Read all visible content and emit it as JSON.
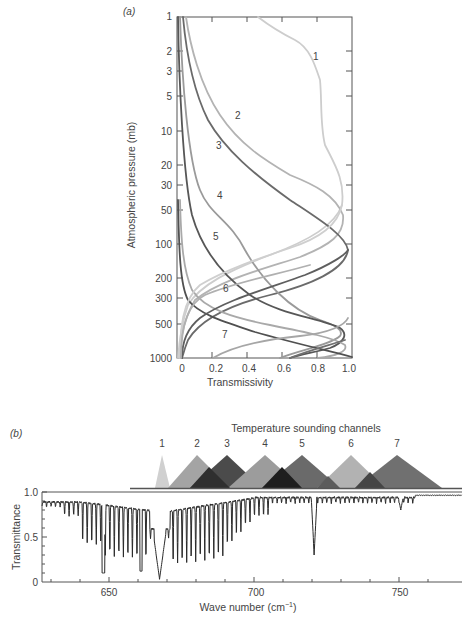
{
  "chart_data": [
    {
      "panel": "(a)",
      "type": "line",
      "title": "",
      "xlabel": "Transmissivity",
      "ylabel": "Atmospheric pressure (mb)",
      "xlim": [
        0,
        1.0
      ],
      "ylim": [
        1000,
        1
      ],
      "yscale": "log",
      "x_ticks": [
        "0",
        "0.2",
        "0.4",
        "0.6",
        "0.8",
        "1.0"
      ],
      "y_ticks": [
        "1",
        "2",
        "3",
        "5",
        "10",
        "20",
        "30",
        "50",
        "100",
        "200",
        "300",
        "500",
        "1000"
      ],
      "grid": false,
      "series": [
        {
          "name": "1",
          "color": "#c8c8c8",
          "transmissivity_curve": [
            [
              0.55,
              1
            ],
            [
              0.72,
              2
            ],
            [
              0.8,
              5
            ],
            [
              0.82,
              10
            ],
            [
              0.88,
              20
            ],
            [
              0.94,
              30
            ],
            [
              0.9,
              50
            ],
            [
              0.6,
              100
            ],
            [
              0.3,
              200
            ],
            [
              0.1,
              300
            ],
            [
              0.04,
              500
            ],
            [
              0,
              1000
            ]
          ]
        },
        {
          "name": "2",
          "color": "#b0b0b0",
          "transmissivity_curve": [
            [
              0.02,
              1
            ],
            [
              0.1,
              2
            ],
            [
              0.2,
              5
            ],
            [
              0.35,
              10
            ],
            [
              0.6,
              20
            ],
            [
              0.82,
              30
            ],
            [
              0.93,
              50
            ],
            [
              0.8,
              100
            ],
            [
              0.45,
              200
            ],
            [
              0.25,
              300
            ],
            [
              0.1,
              500
            ],
            [
              0,
              1000
            ]
          ]
        },
        {
          "name": "3",
          "color": "#6e6e6e",
          "transmissivity_curve": [
            [
              0.02,
              1
            ],
            [
              0.05,
              2
            ],
            [
              0.1,
              5
            ],
            [
              0.18,
              10
            ],
            [
              0.35,
              20
            ],
            [
              0.55,
              30
            ],
            [
              0.8,
              50
            ],
            [
              0.97,
              100
            ],
            [
              0.75,
              200
            ],
            [
              0.45,
              300
            ],
            [
              0.15,
              500
            ],
            [
              0,
              1000
            ]
          ]
        },
        {
          "name": "4",
          "color": "#9a9a9a",
          "transmissivity_curve": [
            [
              0.01,
              1
            ],
            [
              0.02,
              5
            ],
            [
              0.05,
              10
            ],
            [
              0.12,
              20
            ],
            [
              0.18,
              30
            ],
            [
              0.25,
              50
            ],
            [
              0.4,
              100
            ],
            [
              0.6,
              200
            ],
            [
              0.8,
              300
            ],
            [
              0.95,
              400
            ],
            [
              0.7,
              600
            ],
            [
              0.4,
              1000
            ]
          ]
        },
        {
          "name": "5",
          "color": "#5a5a5a",
          "transmissivity_curve": [
            [
              0.01,
              1
            ],
            [
              0.02,
              10
            ],
            [
              0.05,
              30
            ],
            [
              0.1,
              50
            ],
            [
              0.2,
              100
            ],
            [
              0.35,
              200
            ],
            [
              0.55,
              300
            ],
            [
              0.85,
              400
            ],
            [
              0.95,
              500
            ],
            [
              0.7,
              700
            ],
            [
              0.6,
              1000
            ]
          ]
        },
        {
          "name": "6",
          "color": "#a8a8a8",
          "transmissivity_curve": [
            [
              0.02,
              35
            ],
            [
              0.03,
              100
            ],
            [
              0.08,
              200
            ],
            [
              0.2,
              300
            ],
            [
              0.45,
              400
            ],
            [
              0.75,
              500
            ],
            [
              0.95,
              600
            ],
            [
              0.9,
              800
            ],
            [
              0.8,
              1000
            ]
          ]
        },
        {
          "name": "7",
          "color": "#505050",
          "transmissivity_curve": [
            [
              0.01,
              35
            ],
            [
              0.02,
              100
            ],
            [
              0.05,
              200
            ],
            [
              0.12,
              300
            ],
            [
              0.3,
              400
            ],
            [
              0.6,
              550
            ],
            [
              0.85,
              700
            ],
            [
              1.0,
              1000
            ]
          ]
        }
      ]
    },
    {
      "panel": "(b)",
      "type": "line",
      "title": "Temperature sounding channels",
      "xlabel": "Wave number (cm⁻¹)",
      "ylabel": "Transmittance",
      "xlim": [
        627,
        771
      ],
      "ylim": [
        0,
        1.0
      ],
      "x_ticks": [
        "650",
        "700",
        "750"
      ],
      "y_ticks": [
        "0",
        "0.5",
        "1.0"
      ],
      "grid": false,
      "channels": [
        {
          "name": "1",
          "center": 669,
          "half_width": 2.5,
          "color": "#cfcfcf"
        },
        {
          "name": "2",
          "center": 677,
          "half_width": 10,
          "color": "#a3a3a3"
        },
        {
          "name": "3",
          "center": 691,
          "half_width": 12,
          "color": "#4a4a4a"
        },
        {
          "name": "4",
          "center": 704,
          "half_width": 12,
          "color": "#9b9b9b"
        },
        {
          "name": "5",
          "center": 716,
          "half_width": 13,
          "color": "#6c6c6c"
        },
        {
          "name": "6",
          "center": 732,
          "half_width": 12,
          "color": "#b1b1b1"
        },
        {
          "name": "7",
          "center": 748,
          "half_width": 15,
          "color": "#6f6f6f"
        }
      ],
      "transmittance_features": [
        {
          "wavenumber": 627,
          "value": 0.88
        },
        {
          "wavenumber": 640,
          "value": 0.85
        },
        {
          "wavenumber": 648,
          "value": 0.1,
          "note": "deep line"
        },
        {
          "wavenumber": 655,
          "value": 0.3
        },
        {
          "wavenumber": 661,
          "value": 0.12,
          "note": "deep line"
        },
        {
          "wavenumber": 664,
          "value": 0.55
        },
        {
          "wavenumber": 667,
          "value": 0.03,
          "note": "Q-branch minimum"
        },
        {
          "wavenumber": 672,
          "value": 0.28
        },
        {
          "wavenumber": 680,
          "value": 0.22
        },
        {
          "wavenumber": 690,
          "value": 0.3
        },
        {
          "wavenumber": 700,
          "value": 0.6
        },
        {
          "wavenumber": 710,
          "value": 0.95
        },
        {
          "wavenumber": 720,
          "value": 0.3,
          "note": "sharp line"
        },
        {
          "wavenumber": 730,
          "value": 0.95
        },
        {
          "wavenumber": 750,
          "value": 0.8,
          "note": "small line"
        },
        {
          "wavenumber": 771,
          "value": 0.97
        }
      ]
    }
  ],
  "panel_a": {
    "label": "(a)",
    "xlabel": "Transmissivity",
    "ylabel": "Atmospheric pressure (mb)",
    "x_ticks": [
      "0",
      "0.2",
      "0.4",
      "0.6",
      "0.8",
      "1.0"
    ],
    "y_ticks": [
      "1",
      "2",
      "3",
      "5",
      "10",
      "20",
      "30",
      "50",
      "100",
      "200",
      "300",
      "500",
      "1000"
    ],
    "curve_labels": [
      "1",
      "2",
      "3",
      "4",
      "5",
      "6",
      "7"
    ]
  },
  "panel_b": {
    "label": "(b)",
    "title": "Temperature sounding channels",
    "xlabel": "Wave number (cm",
    "xlabel_sup": "−1",
    "xlabel_close": ")",
    "ylabel": "Transmittance",
    "x_ticks": [
      "650",
      "700",
      "750"
    ],
    "y_ticks": [
      "0",
      "0.5",
      "1.0"
    ],
    "channel_labels": [
      "1",
      "2",
      "3",
      "4",
      "5",
      "6",
      "7"
    ]
  }
}
